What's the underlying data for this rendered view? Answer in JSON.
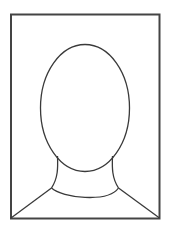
{
  "image": {
    "alt": "Passport photo placeholder silhouette",
    "stroke_color": "#3a3a3a",
    "frame_color": "#444444",
    "background": "#ffffff"
  }
}
